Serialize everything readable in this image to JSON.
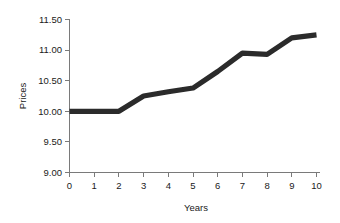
{
  "chart_data": {
    "type": "line",
    "title": "",
    "xlabel": "Years",
    "ylabel": "Prices",
    "x": [
      0,
      1,
      2,
      3,
      4,
      5,
      6,
      7,
      8,
      9,
      10
    ],
    "values": [
      10.0,
      10.0,
      10.0,
      10.25,
      10.32,
      10.38,
      10.65,
      10.95,
      10.93,
      11.2,
      11.25
    ],
    "series": [
      {
        "name": "Prices",
        "color": "#2b2b2b",
        "values": [
          10.0,
          10.0,
          10.0,
          10.25,
          10.32,
          10.38,
          10.65,
          10.95,
          10.93,
          11.2,
          11.25
        ]
      }
    ],
    "xlim": [
      0,
      10
    ],
    "ylim": [
      9.0,
      11.5
    ],
    "xticks": [
      "0",
      "1",
      "2",
      "3",
      "4",
      "5",
      "6",
      "7",
      "8",
      "9",
      "10"
    ],
    "xtick_values": [
      0,
      1,
      2,
      3,
      4,
      5,
      6,
      7,
      8,
      9,
      10
    ],
    "yticks": [
      "9.00",
      "9.50",
      "10.00",
      "10.50",
      "11.00",
      "11.50"
    ],
    "ytick_values": [
      9.0,
      9.5,
      10.0,
      10.5,
      11.0,
      11.5
    ],
    "grid": false,
    "legend": false,
    "legend_position": "none",
    "annotations": []
  },
  "axis": {
    "x_title": "Years",
    "y_title": "Prices"
  },
  "colors": {
    "line": "#2b2b2b",
    "axis": "#7a7a7a",
    "text": "#1a1a1a",
    "background": "#ffffff"
  }
}
